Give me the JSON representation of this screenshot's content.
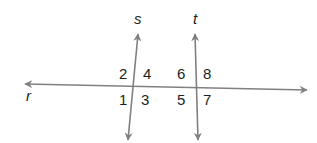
{
  "diagram": {
    "line_color": "#808080",
    "text_color": "#231f20",
    "lines": [
      {
        "name": "r",
        "label": "r",
        "x1": 25,
        "y1": 84,
        "x2": 307,
        "y2": 90,
        "label_x": 26,
        "label_y": 101
      },
      {
        "name": "s",
        "label": "s",
        "x1": 138,
        "y1": 34,
        "x2": 128,
        "y2": 140,
        "label_x": 134,
        "label_y": 24
      },
      {
        "name": "t",
        "label": "t",
        "x1": 195,
        "y1": 34,
        "x2": 198,
        "y2": 140,
        "label_x": 193,
        "label_y": 24
      }
    ],
    "angles": [
      {
        "label": "1",
        "x": 119,
        "y": 105
      },
      {
        "label": "2",
        "x": 119,
        "y": 79
      },
      {
        "label": "3",
        "x": 141,
        "y": 105
      },
      {
        "label": "4",
        "x": 143,
        "y": 79
      },
      {
        "label": "5",
        "x": 177,
        "y": 105
      },
      {
        "label": "6",
        "x": 177,
        "y": 79
      },
      {
        "label": "7",
        "x": 203,
        "y": 105
      },
      {
        "label": "8",
        "x": 203,
        "y": 79
      }
    ]
  }
}
